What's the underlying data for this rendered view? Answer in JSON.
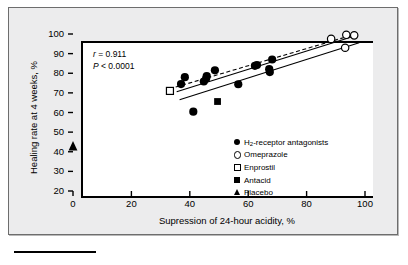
{
  "figure": {
    "background_color": "#ececed",
    "plot_background_color": "#ffffff",
    "axis_color": "#000000"
  },
  "annotations": {
    "correlation_label": "r",
    "correlation_text": "= 0.911",
    "pvalue_label": "P",
    "pvalue_text": "< 0.0001"
  },
  "legend": {
    "items": [
      {
        "label": "H",
        "sub": "2",
        "label_rest": "-receptor antagonists",
        "marker": "filled-circle-icon"
      },
      {
        "label": "Omeprazole",
        "sub": "",
        "label_rest": "",
        "marker": "open-circle-icon"
      },
      {
        "label": "Enprostil",
        "sub": "",
        "label_rest": "",
        "marker": "open-square-icon"
      },
      {
        "label": "Antacid",
        "sub": "",
        "label_rest": "",
        "marker": "filled-square-icon"
      },
      {
        "label": "Placebo",
        "sub": "",
        "label_rest": "",
        "marker": "filled-triangle-icon"
      }
    ]
  },
  "chart_data": {
    "type": "scatter",
    "title": "",
    "xlabel": "Supression of 24-hour acidity, %",
    "ylabel": "Healing rate at 4 weeks, %",
    "xlim": [
      0,
      100
    ],
    "ylim": [
      20,
      100
    ],
    "xticks": [
      0,
      20,
      40,
      60,
      80,
      100
    ],
    "yticks": [
      20,
      30,
      40,
      50,
      60,
      70,
      80,
      90,
      100
    ],
    "xticklabels": [
      "0",
      "20",
      "40",
      "60",
      "80",
      "100"
    ],
    "yticklabels": [
      "20",
      "30",
      "40",
      "50",
      "60",
      "70",
      "80",
      "90",
      "100"
    ],
    "grid": false,
    "legend_position": "center-right",
    "annotations": [
      "r = 0.911",
      "P < 0.0001"
    ],
    "series": [
      {
        "name": "H2-receptor antagonists",
        "marker": "filled-circle",
        "points": [
          [
            37.0,
            74.5
          ],
          [
            38.3,
            78.0
          ],
          [
            41.2,
            60.4
          ],
          [
            44.8,
            75.8
          ],
          [
            45.6,
            77.3
          ],
          [
            45.8,
            78.6
          ],
          [
            48.6,
            81.5
          ],
          [
            56.6,
            74.4
          ],
          [
            62.3,
            83.8
          ],
          [
            63.0,
            84.2
          ],
          [
            67.2,
            82.1
          ],
          [
            67.4,
            80.6
          ],
          [
            68.2,
            87.0
          ]
        ]
      },
      {
        "name": "Omeprazole",
        "marker": "open-circle",
        "points": [
          [
            88.4,
            97.5
          ],
          [
            93.2,
            93.0
          ],
          [
            93.6,
            99.6
          ],
          [
            96.3,
            99.3
          ]
        ]
      },
      {
        "name": "Enprostil",
        "marker": "open-square",
        "points": [
          [
            33.2,
            71.0
          ]
        ]
      },
      {
        "name": "Antacid",
        "marker": "filled-square",
        "points": [
          [
            49.5,
            65.6
          ]
        ]
      },
      {
        "name": "Placebo",
        "marker": "filled-triangle",
        "points": [
          [
            0.0,
            42.8
          ]
        ]
      }
    ],
    "regression_lines": [
      {
        "name": "upper-dashed-line",
        "style": "dashed",
        "x0": 33.0,
        "y0": 72.0,
        "x1": 96.5,
        "y1": 99.8
      },
      {
        "name": "middle-solid-line",
        "style": "solid",
        "x0": 35.5,
        "y0": 70.6,
        "x1": 97.0,
        "y1": 99.2
      },
      {
        "name": "lower-solid-line",
        "style": "solid",
        "x0": 36.5,
        "y0": 66.5,
        "x1": 98.0,
        "y1": 95.5
      }
    ]
  }
}
